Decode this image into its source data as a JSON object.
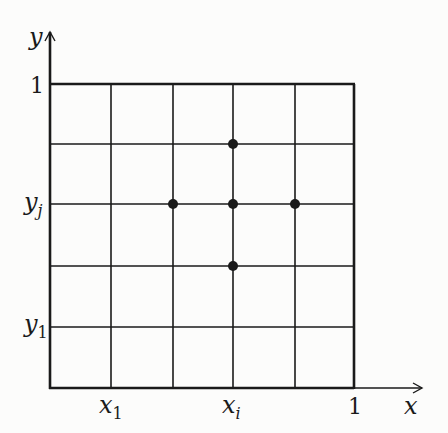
{
  "diagram": {
    "axes": {
      "x_label": "x",
      "y_label": "y",
      "x_end_tick": "1",
      "y_end_tick": "1",
      "x_ticks": [
        {
          "label": "x",
          "sub": "1",
          "grid_index": 1
        },
        {
          "label": "x",
          "sub": "i",
          "grid_index": 3
        }
      ],
      "y_ticks": [
        {
          "label": "y",
          "sub": "j",
          "grid_index": 3
        },
        {
          "label": "y",
          "sub": "1",
          "grid_index": 1
        }
      ]
    },
    "grid": {
      "columns": 5,
      "rows": 5
    },
    "stencil_points": [
      {
        "name": "center",
        "i": 3,
        "j": 3
      },
      {
        "name": "north",
        "i": 3,
        "j": 4
      },
      {
        "name": "south",
        "i": 3,
        "j": 2
      },
      {
        "name": "west",
        "i": 2,
        "j": 3
      },
      {
        "name": "east",
        "i": 4,
        "j": 3
      }
    ],
    "colors": {
      "line": "#1a1a1a",
      "background": "#fcfcfb"
    }
  }
}
